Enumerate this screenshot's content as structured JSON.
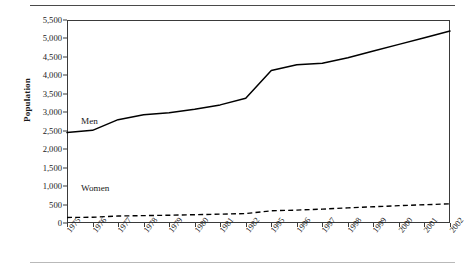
{
  "chart_data": {
    "type": "line",
    "title": "",
    "xlabel": "",
    "ylabel": "Population",
    "ylim": [
      0,
      5500
    ],
    "ytick_step": 500,
    "grid": false,
    "legend_position": "inline-annotation",
    "yticks": [
      "5,500",
      "5,000",
      "4,500",
      "4,000",
      "3,500",
      "3,000",
      "2,500",
      "2,000",
      "1,500",
      "1,000",
      "500",
      "0"
    ],
    "ytick_values": [
      5500,
      5000,
      4500,
      4000,
      3500,
      3000,
      2500,
      2000,
      1500,
      1000,
      500,
      0
    ],
    "categories": [
      "1975",
      "1976",
      "1977",
      "1978",
      "1979",
      "1980",
      "1981",
      "1982",
      "1995",
      "1996",
      "1997",
      "1998",
      "1999",
      "2000",
      "2001",
      "2002"
    ],
    "series": [
      {
        "name": "Men",
        "style": "solid",
        "color": "#000000",
        "values": [
          2450,
          2510,
          2800,
          2930,
          2990,
          3080,
          3200,
          3380,
          4130,
          4290,
          4330,
          4480,
          4660,
          4840,
          5020,
          5200
        ]
      },
      {
        "name": "Women",
        "style": "dashed",
        "color": "#000000",
        "values": [
          150,
          155,
          190,
          200,
          210,
          225,
          240,
          255,
          330,
          350,
          375,
          410,
          440,
          470,
          495,
          520
        ]
      }
    ],
    "annotations": [
      {
        "text": "Men",
        "series": "Men"
      },
      {
        "text": "Women",
        "series": "Women"
      }
    ]
  }
}
